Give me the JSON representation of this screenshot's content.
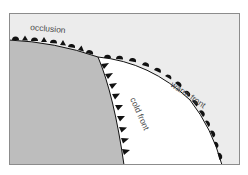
{
  "diagram": {
    "labels": {
      "occlusion": "occlusion",
      "warm_front": "warm front",
      "cold_front": "cold front"
    },
    "colors": {
      "cold_air": "#bdbdbd",
      "warm_sector": "#ffffff",
      "background_air": "#ececec",
      "frame": "#8c8c8c",
      "front_symbols": "#111111",
      "label_text": "#4a4a4a"
    }
  }
}
